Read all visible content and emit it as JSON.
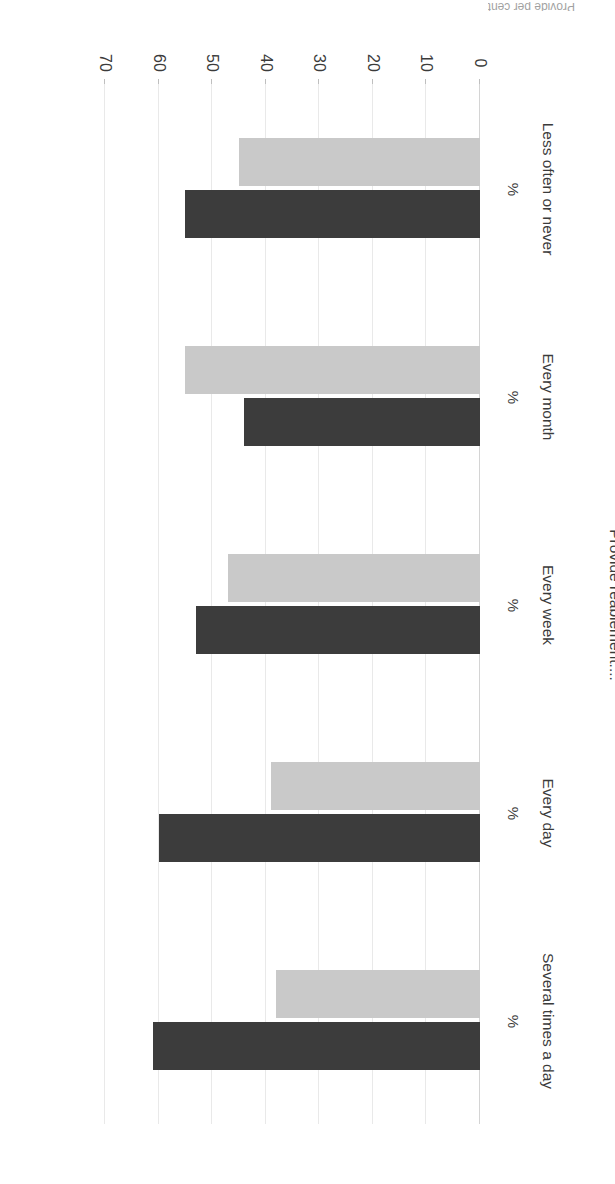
{
  "figure": {
    "title_truncated": "Provide per cent"
  },
  "chart_data": {
    "type": "bar",
    "orientation": "vertical-grouped",
    "title": "",
    "xlabel": "Provide reablement....",
    "ylabel": "Have you seriously considereing resigning lately?",
    "categories": [
      "Several times a day",
      "Every day",
      "Every week",
      "Every month",
      "Less often or never"
    ],
    "category_unit_labels": [
      "%",
      "%",
      "%",
      "%",
      "%"
    ],
    "series": [
      {
        "name": "Series 1",
        "color": "#3c3c3c",
        "values": [
          61,
          60,
          53,
          44,
          55
        ]
      },
      {
        "name": "Series 2",
        "color": "#c9c9c9",
        "values": [
          38,
          39,
          47,
          55,
          45
        ]
      }
    ],
    "ylim": [
      0,
      70
    ],
    "yticks": [
      0,
      10,
      20,
      30,
      40,
      50,
      60,
      70
    ],
    "ytick_labels": [
      "0",
      "10",
      "20",
      "30",
      "40",
      "50",
      "60",
      "70"
    ],
    "grid": true,
    "legend": "none",
    "rotation_degrees": 180
  }
}
